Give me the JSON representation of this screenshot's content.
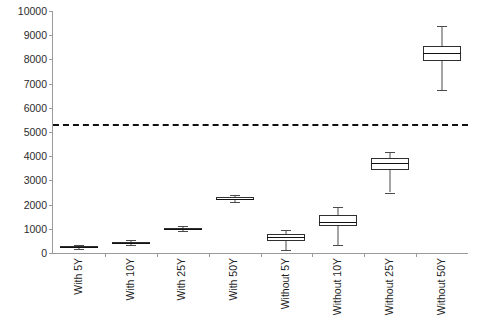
{
  "chart_data": {
    "type": "box",
    "title": "",
    "xlabel": "",
    "ylabel": "",
    "ylim": [
      0,
      10000
    ],
    "ytick_step": 1000,
    "yticks": [
      "10000",
      "9000",
      "8000",
      "7000",
      "6000",
      "5000",
      "4000",
      "3000",
      "2000",
      "1000",
      "0"
    ],
    "grid": false,
    "legend": "none",
    "categories": [
      "With 5Y",
      "With 10Y",
      "With 25Y",
      "With 50Y",
      "Without 5Y",
      "Without 10Y",
      "Without 25Y",
      "Without 50Y"
    ],
    "boxes": [
      {
        "category": "With 5Y",
        "min": 170,
        "q1": 210,
        "median": 245,
        "q3": 280,
        "max": 320
      },
      {
        "category": "With 10Y",
        "min": 350,
        "q1": 400,
        "median": 430,
        "q3": 470,
        "max": 520
      },
      {
        "category": "With 25Y",
        "min": 900,
        "q1": 960,
        "median": 1000,
        "q3": 1050,
        "max": 1110
      },
      {
        "category": "With 50Y",
        "min": 2120,
        "q1": 2200,
        "median": 2250,
        "q3": 2300,
        "max": 2380
      },
      {
        "category": "Without 5Y",
        "min": 130,
        "q1": 510,
        "median": 660,
        "q3": 800,
        "max": 960
      },
      {
        "category": "Without 10Y",
        "min": 340,
        "q1": 1120,
        "median": 1300,
        "q3": 1550,
        "max": 1920
      },
      {
        "category": "Without 25Y",
        "min": 2500,
        "q1": 3450,
        "median": 3700,
        "q3": 3930,
        "max": 4180
      },
      {
        "category": "Without 50Y",
        "min": 6750,
        "q1": 7950,
        "median": 8250,
        "q3": 8550,
        "max": 9400
      }
    ],
    "reference_line": {
      "label": "threshold",
      "value": 5330,
      "style": "dashed",
      "color": "#111111"
    },
    "colors": {
      "box_stroke": "#2f2f2f",
      "box_fill": "#ffffff",
      "median": "#111111",
      "whisker": "#4a4a4a",
      "axis": "#9a9a9a",
      "tick_text": "#2b2b2b",
      "category_text": "#1f1f1f"
    }
  }
}
